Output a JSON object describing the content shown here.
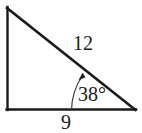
{
  "figure": {
    "type": "right-triangle-diagram",
    "background_color": "#ffffff",
    "stroke_color": "#1a1a1a",
    "labels": {
      "hypotenuse": "12",
      "angle": "38°",
      "base": "9"
    },
    "geometry": {
      "vertices": {
        "top_left": [
          7,
          7
        ],
        "bottom_left": [
          7,
          110
        ],
        "bottom_right": [
          135,
          110
        ]
      },
      "right_angle_at": "bottom_left",
      "marked_angle_at": "bottom_right",
      "marked_angle_degrees": 38,
      "hypotenuse_length": 12,
      "base_length": 9,
      "angle_arc": {
        "center": [
          135,
          110
        ],
        "radius": 64,
        "has_arrowhead": true,
        "arrow_tip": [
          82,
          74
        ]
      }
    }
  }
}
